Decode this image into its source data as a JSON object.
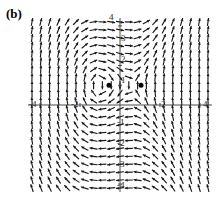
{
  "figure": {
    "panel_label": "(b)",
    "type": "vector-field",
    "background_color": "#ffffff",
    "axis_color": "#4a4a4a",
    "arrow_color": "#1a1a1a",
    "point_color": "#000000"
  },
  "chart_data": {
    "type": "scatter",
    "title": "(b)",
    "xlabel": "",
    "ylabel": "",
    "xlim": [
      -4.6,
      4.6
    ],
    "ylim": [
      -4.4,
      4.4
    ],
    "grid": false,
    "legend": null,
    "x_ticks": [
      -4,
      -2,
      2,
      4
    ],
    "x_tick_labels": [
      "-4",
      "-2",
      "2",
      "4"
    ],
    "y_ticks": [
      -4,
      -3,
      -2,
      -1,
      1,
      2,
      3,
      4
    ],
    "y_tick_labels": [
      "-4",
      "-3",
      "-2",
      "-1",
      "1",
      "2",
      "3",
      "4"
    ],
    "field": {
      "description": "normalized direction field arrows on a regular grid",
      "x_start": -4.4,
      "x_end": 4.4,
      "x_step": 0.44,
      "y_start": -4.2,
      "y_end": 4.2,
      "y_step": 0.4,
      "equations": {
        "dx": "y - 1",
        "dy": "x*x + 0.5*x - 0.5 - (y-1)*(y-1)*0.0"
      }
    },
    "critical_points": [
      {
        "name": "spiral-point-left",
        "x": -0.55,
        "y": 1.0,
        "marker": "filled-circle",
        "size": 5
      },
      {
        "name": "saddle-point-right",
        "x": 1.05,
        "y": 1.0,
        "marker": "filled-circle",
        "size": 5
      }
    ]
  },
  "axis_labels": {
    "y_top": "4",
    "y_3": "3",
    "y_2": "2",
    "y_1": "1",
    "y_m1": "-1",
    "y_m2": "-2",
    "y_m3": "-3",
    "y_m4": "-4",
    "x_m4": "-4",
    "x_m2": "-2",
    "x_2": "2",
    "x_4": "4"
  }
}
